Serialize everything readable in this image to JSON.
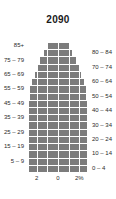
{
  "chart_data": {
    "type": "bar",
    "subtype": "population-pyramid",
    "title": "2090",
    "xlabel": "",
    "ylabel": "",
    "orientation": "horizontal",
    "grid": true,
    "legend": null,
    "axis_unit": "%",
    "xlim": [
      -3,
      3
    ],
    "xticks": [
      {
        "label": "2",
        "value": -2
      },
      {
        "label": "0",
        "value": 0
      },
      {
        "label": "2%",
        "value": 2
      }
    ],
    "categories": [
      "0 – 4",
      "5 – 9",
      "10 – 14",
      "15 – 19",
      "20 – 24",
      "25 – 29",
      "30 – 34",
      "35 – 39",
      "40 – 44",
      "45 – 49",
      "50 – 54",
      "55 – 59",
      "60 – 64",
      "65 – 69",
      "70 – 74",
      "75 – 79",
      "80 – 84",
      "85+"
    ],
    "left_axis_labels": [
      "5 – 9",
      "15 – 19",
      "25 – 29",
      "35 – 39",
      "45 – 49",
      "55 – 59",
      "65 – 69",
      "75 – 79",
      "85+"
    ],
    "right_axis_labels": [
      "0 – 4",
      "10 – 14",
      "20 – 24",
      "30 – 34",
      "40 – 44",
      "50 – 54",
      "60 – 64",
      "70 – 74",
      "80 – 84"
    ],
    "series": [
      {
        "name": "Male",
        "side": "left",
        "color": "#7c7c7c",
        "values": [
          2.7,
          2.7,
          2.7,
          2.7,
          2.7,
          2.7,
          2.7,
          2.7,
          2.7,
          2.7,
          2.65,
          2.6,
          2.4,
          2.2,
          1.95,
          1.7,
          1.35,
          1.05
        ]
      },
      {
        "name": "Female",
        "side": "right",
        "color": "#7c7c7c",
        "values": [
          2.7,
          2.7,
          2.7,
          2.7,
          2.7,
          2.7,
          2.7,
          2.7,
          2.7,
          2.7,
          2.65,
          2.6,
          2.4,
          2.2,
          1.95,
          1.7,
          1.35,
          1.05
        ]
      }
    ]
  },
  "colors": {
    "bar": "#7c7c7c",
    "grid": "#ffffff",
    "background": "#ffffff",
    "text": "#2b2b2b",
    "title": "#1a1a1a"
  }
}
